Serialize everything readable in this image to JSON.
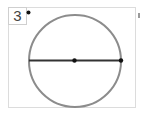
{
  "question": {
    "number_label": "3"
  },
  "figure": {
    "type": "circle-with-diameter",
    "circle_color": "#8c8c8c",
    "line_color": "#333333",
    "point_color": "#111111"
  }
}
